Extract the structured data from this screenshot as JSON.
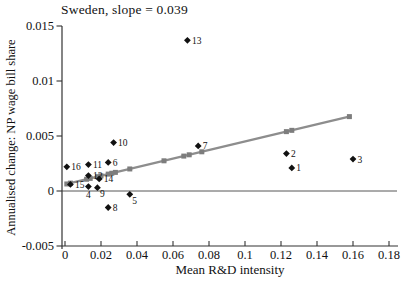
{
  "chart_data": {
    "type": "scatter",
    "title": "Sweden, slope = 0.039",
    "xlabel": "Mean R&D intensity",
    "ylabel": "Annualised change: NP wage bill share",
    "slope": 0.039,
    "xlim": [
      0,
      0.185
    ],
    "ylim": [
      -0.005,
      0.015
    ],
    "grid": false,
    "x_tick_values": [
      0,
      0.02,
      0.04,
      0.06,
      0.08,
      0.1,
      0.12,
      0.14,
      0.16,
      0.18
    ],
    "x_tick_labels": [
      "0",
      "0.02",
      "0.04",
      "0.06",
      "0.08",
      "0.1",
      "0.12",
      "0.14",
      "0.16",
      "0.18"
    ],
    "y_tick_values": [
      -0.005,
      0,
      0.005,
      0.01,
      0.015
    ],
    "y_tick_labels": [
      "-0.005",
      "0",
      "0.005",
      "0.01",
      "0.015"
    ],
    "points": [
      {
        "label": "1",
        "x": 0.126,
        "y": 0.0021,
        "lp": "right"
      },
      {
        "label": "2",
        "x": 0.123,
        "y": 0.0034,
        "lp": "right"
      },
      {
        "label": "3",
        "x": 0.16,
        "y": 0.0029,
        "lp": "right"
      },
      {
        "label": "4",
        "x": 0.013,
        "y": 0.0004,
        "lp": "below"
      },
      {
        "label": "5",
        "x": 0.036,
        "y": -0.0003,
        "lp": "belowright"
      },
      {
        "label": "6",
        "x": 0.024,
        "y": 0.0026,
        "lp": "right"
      },
      {
        "label": "7",
        "x": 0.074,
        "y": 0.0041,
        "lp": "right"
      },
      {
        "label": "8",
        "x": 0.024,
        "y": -0.0015,
        "lp": "right"
      },
      {
        "label": "9",
        "x": 0.018,
        "y": 0.0003,
        "lp": "belowright"
      },
      {
        "label": "10",
        "x": 0.027,
        "y": 0.0044,
        "lp": "right"
      },
      {
        "label": "11",
        "x": 0.013,
        "y": 0.0024,
        "lp": "right"
      },
      {
        "label": "12",
        "x": 0.013,
        "y": 0.0014,
        "lp": "right"
      },
      {
        "label": "13",
        "x": 0.068,
        "y": 0.0137,
        "lp": "right"
      },
      {
        "label": "14",
        "x": 0.019,
        "y": 0.0011,
        "lp": "right"
      },
      {
        "label": "15",
        "x": 0.003,
        "y": 0.0006,
        "lp": "right"
      },
      {
        "label": "16",
        "x": 0.001,
        "y": 0.0022,
        "lp": "right"
      }
    ],
    "fit_line": {
      "intercept": 0.0006,
      "slope": 0.039,
      "x_start": 0.0005,
      "x_end": 0.159,
      "marker_x": [
        0.001,
        0.003,
        0.012,
        0.014,
        0.018,
        0.02,
        0.024,
        0.026,
        0.028,
        0.036,
        0.055,
        0.066,
        0.069,
        0.076,
        0.123,
        0.126,
        0.158
      ]
    },
    "colors": {
      "point": "#111111",
      "point_label": "#111111",
      "fit_line": "#8d8d8d",
      "fit_marker": "#7d7d7d",
      "axis": "#333333",
      "zero_line": "#444444",
      "tick_label": "#111111"
    }
  }
}
